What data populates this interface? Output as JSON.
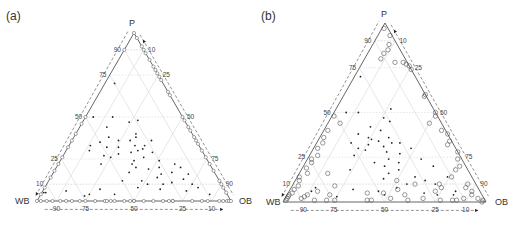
{
  "figure": {
    "panels": [
      {
        "id": "a",
        "label": "(a)"
      },
      {
        "id": "b",
        "label": "(b)"
      }
    ]
  },
  "chart_data": [
    {
      "type": "scatter",
      "subtype": "ternary",
      "panel_label": "(a)",
      "vertices": {
        "top": "P",
        "left": "WB",
        "right": "OB"
      },
      "ticks": {
        "left_edge_P": [
          "10",
          "25",
          "50",
          "75",
          "90"
        ],
        "right_edge_OB": [
          "10",
          "25",
          "50",
          "75",
          "90"
        ],
        "bottom_edge_WB": [
          "90",
          "75",
          "50",
          "25",
          "10"
        ]
      },
      "gridlines": [
        10,
        25,
        50,
        75,
        90
      ],
      "grid": true,
      "colors": {
        "edge": "#555555",
        "grid": "#dddddd",
        "dashed": "#666666",
        "points": "#222222",
        "edge_markers": "#777777"
      },
      "series": [
        {
          "name": "interior points",
          "marker": "dot",
          "points_PWBOB": [
            [
              0.7,
              0.25,
              0.05
            ],
            [
              0.47,
              0.29,
              0.24
            ],
            [
              0.48,
              0.24,
              0.28
            ],
            [
              0.5,
              0.36,
              0.14
            ],
            [
              0.5,
              0.46,
              0.04
            ],
            [
              0.44,
              0.42,
              0.14
            ],
            [
              0.38,
              0.44,
              0.18
            ],
            [
              0.36,
              0.4,
              0.24
            ],
            [
              0.35,
              0.5,
              0.15
            ],
            [
              0.33,
              0.56,
              0.11
            ],
            [
              0.33,
              0.28,
              0.39
            ],
            [
              0.32,
              0.48,
              0.2
            ],
            [
              0.32,
              0.42,
              0.26
            ],
            [
              0.31,
              0.3,
              0.39
            ],
            [
              0.3,
              0.33,
              0.37
            ],
            [
              0.3,
              0.58,
              0.12
            ],
            [
              0.29,
              0.37,
              0.34
            ],
            [
              0.28,
              0.44,
              0.28
            ],
            [
              0.27,
              0.52,
              0.21
            ],
            [
              0.26,
              0.49,
              0.25
            ],
            [
              0.22,
              0.4,
              0.38
            ],
            [
              0.22,
              0.56,
              0.22
            ],
            [
              0.2,
              0.39,
              0.41
            ],
            [
              0.19,
              0.33,
              0.48
            ],
            [
              0.17,
              0.44,
              0.39
            ],
            [
              0.16,
              0.28,
              0.56
            ],
            [
              0.14,
              0.31,
              0.55
            ],
            [
              0.12,
              0.4,
              0.48
            ],
            [
              0.11,
              0.25,
              0.64
            ],
            [
              0.1,
              0.3,
              0.6
            ],
            [
              0.08,
              0.44,
              0.48
            ],
            [
              0.07,
              0.33,
              0.6
            ],
            [
              0.07,
              0.64,
              0.29
            ],
            [
              0.06,
              0.82,
              0.12
            ],
            [
              0.05,
              0.94,
              0.01
            ],
            [
              0.05,
              0.93,
              0.02
            ],
            [
              0.04,
              0.58,
              0.38
            ],
            [
              0.04,
              0.71,
              0.25
            ],
            [
              0.03,
              0.74,
              0.23
            ],
            [
              0.17,
              0.22,
              0.61
            ],
            [
              0.4,
              0.29,
              0.31
            ],
            [
              0.38,
              0.3,
              0.32
            ],
            [
              0.36,
              0.34,
              0.3
            ],
            [
              0.24,
              0.25,
              0.51
            ],
            [
              0.22,
              0.18,
              0.6
            ],
            [
              0.2,
              0.16,
              0.64
            ],
            [
              0.16,
              0.14,
              0.7
            ],
            [
              0.13,
              0.18,
              0.69
            ],
            [
              0.1,
              0.15,
              0.75
            ],
            [
              0.08,
              0.13,
              0.79
            ],
            [
              0.06,
              0.2,
              0.74
            ],
            [
              0.04,
              0.09,
              0.87
            ],
            [
              0.36,
              0.23,
              0.41
            ],
            [
              0.33,
              0.33,
              0.34
            ],
            [
              0.29,
              0.26,
              0.45
            ],
            [
              0.26,
              0.32,
              0.42
            ],
            [
              0.24,
              0.38,
              0.38
            ],
            [
              0.2,
              0.27,
              0.53
            ],
            [
              0.12,
              0.5,
              0.38
            ],
            [
              0.1,
              0.38,
              0.52
            ]
          ]
        },
        {
          "name": "edge points",
          "marker": "open-circle",
          "note": "points lying on triangle edges (binary mixtures)"
        }
      ]
    },
    {
      "type": "scatter",
      "subtype": "ternary",
      "panel_label": "(b)",
      "vertices": {
        "top": "P",
        "left": "WB",
        "right": "OB"
      },
      "ticks": {
        "left_edge_P": [
          "10",
          "25",
          "50",
          "75",
          "90"
        ],
        "right_edge_OB": [
          "10",
          "25",
          "50",
          "75",
          "90"
        ],
        "bottom_edge_WB": [
          "90",
          "75",
          "50",
          "25",
          "10"
        ]
      },
      "gridlines": [
        10,
        25,
        50,
        75,
        90
      ],
      "grid": true,
      "colors": {
        "edge": "#555555",
        "grid": "#dddddd",
        "dashed": "#666666",
        "points": "#222222",
        "open_circles": "#555555"
      },
      "series": [
        {
          "name": "filled points",
          "marker": "dot",
          "points_PWBOB": [
            [
              0.7,
              0.27,
              0.03
            ],
            [
              0.47,
              0.27,
              0.26
            ],
            [
              0.45,
              0.25,
              0.3
            ],
            [
              0.52,
              0.21,
              0.27
            ],
            [
              0.5,
              0.44,
              0.06
            ],
            [
              0.5,
              0.38,
              0.12
            ],
            [
              0.42,
              0.36,
              0.22
            ],
            [
              0.38,
              0.44,
              0.18
            ],
            [
              0.36,
              0.4,
              0.24
            ],
            [
              0.35,
              0.39,
              0.26
            ],
            [
              0.33,
              0.5,
              0.17
            ],
            [
              0.33,
              0.3,
              0.37
            ],
            [
              0.33,
              0.26,
              0.41
            ],
            [
              0.32,
              0.42,
              0.26
            ],
            [
              0.31,
              0.35,
              0.34
            ],
            [
              0.3,
              0.48,
              0.22
            ],
            [
              0.29,
              0.45,
              0.26
            ],
            [
              0.28,
              0.35,
              0.37
            ],
            [
              0.27,
              0.29,
              0.44
            ],
            [
              0.26,
              0.52,
              0.22
            ],
            [
              0.24,
              0.36,
              0.4
            ],
            [
              0.22,
              0.44,
              0.34
            ],
            [
              0.22,
              0.32,
              0.46
            ],
            [
              0.2,
              0.4,
              0.4
            ],
            [
              0.18,
              0.34,
              0.48
            ],
            [
              0.16,
              0.4,
              0.44
            ],
            [
              0.14,
              0.28,
              0.58
            ],
            [
              0.13,
              0.44,
              0.43
            ],
            [
              0.12,
              0.24,
              0.64
            ],
            [
              0.1,
              0.34,
              0.56
            ],
            [
              0.08,
              0.4,
              0.52
            ],
            [
              0.07,
              0.62,
              0.31
            ],
            [
              0.06,
              0.5,
              0.44
            ],
            [
              0.05,
              0.28,
              0.67
            ],
            [
              0.04,
              0.22,
              0.74
            ],
            [
              0.04,
              0.48,
              0.48
            ],
            [
              0.03,
              0.72,
              0.25
            ],
            [
              0.06,
              0.83,
              0.11
            ],
            [
              0.08,
              0.8,
              0.12
            ],
            [
              0.04,
              0.14,
              0.82
            ],
            [
              0.06,
              0.12,
              0.82
            ],
            [
              0.1,
              0.2,
              0.7
            ],
            [
              0.14,
              0.12,
              0.74
            ],
            [
              0.2,
              0.16,
              0.64
            ],
            [
              0.24,
              0.2,
              0.56
            ],
            [
              0.3,
              0.22,
              0.48
            ],
            [
              0.34,
              0.36,
              0.3
            ],
            [
              0.36,
              0.3,
              0.34
            ],
            [
              0.4,
              0.32,
              0.28
            ],
            [
              0.18,
              0.58,
              0.24
            ]
          ]
        },
        {
          "name": "open circles",
          "marker": "open-circle",
          "points_PWBOB": [
            [
              0.97,
              0.02,
              0.01
            ],
            [
              0.93,
              0.01,
              0.06
            ],
            [
              0.88,
              0.04,
              0.08
            ],
            [
              0.85,
              0.06,
              0.09
            ],
            [
              0.83,
              0.09,
              0.08
            ],
            [
              0.8,
              0.12,
              0.08
            ],
            [
              0.78,
              0.06,
              0.16
            ],
            [
              0.78,
              0.02,
              0.2
            ],
            [
              0.77,
              0.01,
              0.22
            ],
            [
              0.76,
              0.0,
              0.24
            ],
            [
              0.74,
              0.0,
              0.26
            ],
            [
              0.6,
              0.0,
              0.4
            ],
            [
              0.59,
              0.01,
              0.4
            ],
            [
              0.5,
              0.0,
              0.5
            ],
            [
              0.48,
              0.01,
              0.51
            ],
            [
              0.44,
              0.06,
              0.5
            ],
            [
              0.4,
              0.02,
              0.58
            ],
            [
              0.38,
              0.0,
              0.62
            ],
            [
              0.34,
              0.01,
              0.65
            ],
            [
              0.32,
              0.03,
              0.65
            ],
            [
              0.48,
              0.51,
              0.01
            ],
            [
              0.44,
              0.5,
              0.06
            ],
            [
              0.4,
              0.58,
              0.02
            ],
            [
              0.36,
              0.62,
              0.02
            ],
            [
              0.33,
              0.64,
              0.03
            ],
            [
              0.3,
              0.68,
              0.02
            ],
            [
              0.26,
              0.7,
              0.04
            ],
            [
              0.24,
              0.74,
              0.02
            ],
            [
              0.22,
              0.75,
              0.03
            ],
            [
              0.19,
              0.79,
              0.02
            ],
            [
              0.16,
              0.8,
              0.04
            ],
            [
              0.14,
              0.85,
              0.01
            ],
            [
              0.12,
              0.86,
              0.02
            ],
            [
              0.09,
              0.88,
              0.03
            ],
            [
              0.07,
              0.91,
              0.02
            ],
            [
              0.05,
              0.93,
              0.02
            ],
            [
              0.04,
              0.95,
              0.01
            ],
            [
              0.03,
              0.96,
              0.01
            ],
            [
              0.02,
              0.97,
              0.01
            ],
            [
              0.01,
              0.98,
              0.01
            ],
            [
              0.16,
              0.7,
              0.14
            ],
            [
              0.06,
              0.8,
              0.14
            ],
            [
              0.04,
              0.75,
              0.21
            ],
            [
              0.05,
              0.56,
              0.39
            ],
            [
              0.05,
              0.48,
              0.47
            ],
            [
              0.07,
              0.4,
              0.53
            ],
            [
              0.04,
              0.38,
              0.58
            ],
            [
              0.02,
              0.3,
              0.68
            ],
            [
              0.06,
              0.22,
              0.72
            ],
            [
              0.1,
              0.18,
              0.72
            ],
            [
              0.14,
              0.1,
              0.76
            ],
            [
              0.18,
              0.06,
              0.76
            ],
            [
              0.2,
              0.03,
              0.77
            ],
            [
              0.24,
              0.02,
              0.74
            ],
            [
              0.28,
              0.0,
              0.72
            ],
            [
              0.1,
              0.04,
              0.86
            ],
            [
              0.08,
              0.06,
              0.86
            ],
            [
              0.06,
              0.04,
              0.9
            ],
            [
              0.04,
              0.05,
              0.91
            ],
            [
              0.02,
              0.03,
              0.95
            ],
            [
              0.01,
              0.01,
              0.98
            ],
            [
              0.0,
              0.02,
              0.98
            ],
            [
              0.02,
              0.9,
              0.08
            ],
            [
              0.01,
              0.84,
              0.15
            ],
            [
              0.01,
              0.78,
              0.21
            ],
            [
              0.01,
              0.74,
              0.25
            ],
            [
              0.01,
              0.58,
              0.41
            ],
            [
              0.01,
              0.56,
              0.43
            ],
            [
              0.02,
              0.46,
              0.52
            ],
            [
              0.01,
              0.38,
              0.61
            ],
            [
              0.01,
              0.22,
              0.77
            ],
            [
              0.01,
              0.16,
              0.83
            ],
            [
              0.01,
              0.14,
              0.85
            ],
            [
              0.02,
              0.1,
              0.88
            ],
            [
              0.08,
              0.18,
              0.74
            ],
            [
              0.12,
              0.38,
              0.5
            ],
            [
              0.1,
              0.3,
              0.6
            ],
            [
              0.03,
              0.88,
              0.09
            ],
            [
              0.04,
              0.86,
              0.1
            ],
            [
              0.09,
              0.7,
              0.21
            ]
          ]
        }
      ]
    }
  ]
}
